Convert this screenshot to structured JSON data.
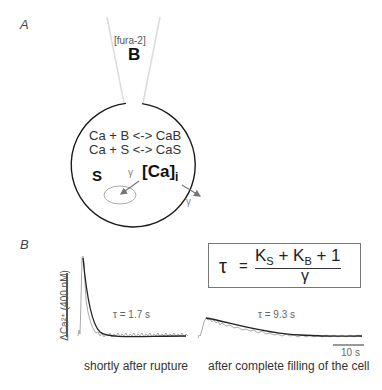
{
  "panel_a": {
    "label": "A",
    "pipette_label": "[fura-2]",
    "buffer_symbol": "B",
    "equations": [
      "Ca + B <-> CaB",
      "Ca + S <-> CaS"
    ],
    "store_symbol": "S",
    "calcium_label": "[Ca]",
    "calcium_subscript": "i",
    "gamma_inner": "γ",
    "gamma_outer": "γ"
  },
  "panel_b": {
    "label": "B",
    "formula": {
      "lhs": "τ",
      "equals": "=",
      "numerator_parts": [
        "K",
        "S",
        " + K",
        "B",
        " + 1"
      ],
      "denominator": "γ"
    },
    "y_scale_label": "ΔCa²⁺ (400 nM)",
    "x_scale_label": "10 s",
    "traces": [
      {
        "tau_label": "τ = 1.7 s",
        "caption": "shortly after rupture"
      },
      {
        "tau_label": "τ = 9.3 s",
        "caption": "after complete filling of the cell"
      }
    ]
  },
  "colors": {
    "outline": "#1a1a1a",
    "trace_raw": "#aaaaaa",
    "trace_fit": "#222222",
    "arrow": "#777777",
    "pipette": "#dddddd"
  }
}
